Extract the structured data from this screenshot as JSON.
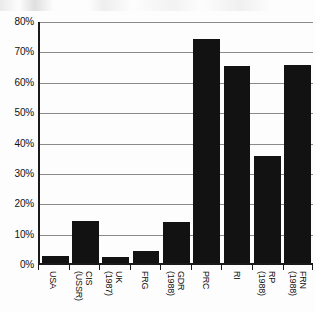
{
  "chart_data": {
    "type": "bar",
    "title": "",
    "xlabel": "",
    "ylabel": "",
    "ylim": [
      0,
      80
    ],
    "grid": true,
    "legend": "none",
    "y_ticks": [
      {
        "value": 80,
        "label": "80%"
      },
      {
        "value": 70,
        "label": "70%"
      },
      {
        "value": 60,
        "label": "60%"
      },
      {
        "value": 50,
        "label": "50%"
      },
      {
        "value": 40,
        "label": "40%"
      },
      {
        "value": 30,
        "label": "30%"
      },
      {
        "value": 20,
        "label": "20%"
      },
      {
        "value": 10,
        "label": "10%"
      },
      {
        "value": 0,
        "label": "0%"
      }
    ],
    "categories": [
      "USA",
      "CIS (USSR)",
      "UK (1987)",
      "FRG",
      "GDR (1988)",
      "PRC",
      "RI",
      "RP (1988)",
      "FRN (1988)"
    ],
    "category_labels": [
      {
        "line1": "USA",
        "line2": ""
      },
      {
        "line1": "CIS",
        "line2": "(USSR)"
      },
      {
        "line1": "UK",
        "line2": "(1987)"
      },
      {
        "line1": "FRG",
        "line2": ""
      },
      {
        "line1": "GDR",
        "line2": "(1988)"
      },
      {
        "line1": "PRC",
        "line2": ""
      },
      {
        "line1": "RI",
        "line2": ""
      },
      {
        "line1": "RP",
        "line2": "(1988)"
      },
      {
        "line1": "FRN",
        "line2": "(1988)"
      }
    ],
    "values": [
      3,
      14.5,
      2.5,
      4.5,
      14,
      74.5,
      65.5,
      36,
      66
    ],
    "bar_color": "#121212",
    "gridline_color": "#8a8a8a",
    "axis_color": "#1a1a1a"
  }
}
